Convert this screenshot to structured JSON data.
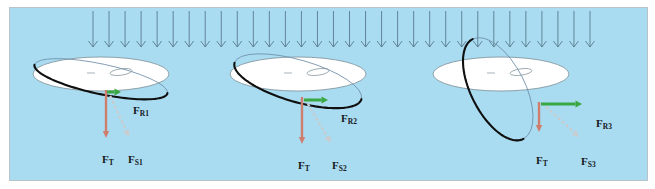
{
  "figure": {
    "background_color": "#a9dcf1",
    "border_color": "#b9c4c9",
    "page_background": "#ffffff",
    "width": 655,
    "height": 189
  },
  "colors": {
    "incident_rays": "#5a7b8c",
    "disk_fill": "#ffffff",
    "disk_outline": "#7a8d96",
    "tilted_ellipse_dark": "#101010",
    "tilted_ellipse_light": "#6f8fa8",
    "force_total_arrow": "#cf7e6e",
    "force_radial_arrow": "#3aa842",
    "force_shear_arrow": "#c9ccce",
    "label_text": "#16181c"
  },
  "incident_field": {
    "name": "incident-radiation-arrows",
    "arrow_count": 32,
    "x_start": 92,
    "x_end": 589,
    "y_top": 10,
    "y_bottom": 46,
    "direction": "down"
  },
  "panels": [
    {
      "id": "panel-1",
      "name": "tilt-case-1",
      "tilt_description": "shallow-tilt",
      "disk": {
        "cx": 100,
        "cy": 73,
        "rx": 68,
        "ry": 17
      },
      "tilted_ellipse": {
        "cx": 100,
        "cy": 78,
        "rx": 68,
        "ry": 15,
        "rotation_deg": 12
      },
      "vectors": {
        "total": {
          "label": "F",
          "subscript": "T",
          "name": "force-total-vector-1",
          "x1": 105,
          "y1": 89,
          "x2": 105,
          "y2": 137,
          "color": "#cf7e6e",
          "label_x": 92,
          "label_y": 146
        },
        "radial": {
          "label": "F",
          "subscript": "R",
          "index": "1",
          "name": "force-radial-vector-1",
          "x1": 106,
          "y1": 91,
          "x2": 120,
          "y2": 91,
          "color": "#3aa842",
          "label_x": 123,
          "label_y": 97
        },
        "shear": {
          "label": "F",
          "subscript": "S",
          "index": "1",
          "name": "force-shear-vector-1",
          "x1": 107,
          "y1": 90,
          "x2": 128,
          "y2": 136,
          "color": "#c9ccce",
          "label_x": 118,
          "label_y": 146
        }
      }
    },
    {
      "id": "panel-2",
      "name": "tilt-case-2",
      "tilt_description": "medium-tilt",
      "disk": {
        "cx": 297,
        "cy": 73,
        "rx": 68,
        "ry": 17
      },
      "tilted_ellipse": {
        "cx": 297,
        "cy": 80,
        "rx": 66,
        "ry": 21,
        "rotation_deg": 16
      },
      "vectors": {
        "total": {
          "label": "F",
          "subscript": "T",
          "name": "force-total-vector-2",
          "x1": 301,
          "y1": 96,
          "x2": 301,
          "y2": 143,
          "color": "#cf7e6e",
          "label_x": 288,
          "label_y": 152
        },
        "radial": {
          "label": "F",
          "subscript": "R",
          "index": "2",
          "name": "force-radial-vector-2",
          "x1": 303,
          "y1": 99,
          "x2": 327,
          "y2": 99,
          "color": "#3aa842",
          "label_x": 331,
          "label_y": 105
        },
        "shear": {
          "label": "F",
          "subscript": "S",
          "index": "2",
          "name": "force-shear-vector-2",
          "x1": 304,
          "y1": 98,
          "x2": 330,
          "y2": 142,
          "color": "#c9ccce",
          "label_x": 322,
          "label_y": 152
        }
      }
    },
    {
      "id": "panel-3",
      "name": "tilt-case-3",
      "tilt_description": "steep-tilt",
      "disk": {
        "cx": 500,
        "cy": 73,
        "rx": 68,
        "ry": 17
      },
      "tilted_ellipse": {
        "cx": 497,
        "cy": 88,
        "rx": 56,
        "ry": 27,
        "rotation_deg": 63
      },
      "vectors": {
        "total": {
          "label": "F",
          "subscript": "T",
          "name": "force-total-vector-3",
          "x1": 538,
          "y1": 101,
          "x2": 538,
          "y2": 131,
          "color": "#cf7e6e",
          "label_x": 526,
          "label_y": 147
        },
        "radial": {
          "label": "F",
          "subscript": "R",
          "index": "3",
          "name": "force-radial-vector-3",
          "x1": 540,
          "y1": 103,
          "x2": 581,
          "y2": 103,
          "color": "#3aa842",
          "label_x": 586,
          "label_y": 110
        },
        "shear": {
          "label": "F",
          "subscript": "S",
          "index": "3",
          "name": "force-shear-vector-3",
          "x1": 541,
          "y1": 102,
          "x2": 578,
          "y2": 136,
          "color": "#c9ccce",
          "label_x": 571,
          "label_y": 148
        }
      }
    }
  ]
}
